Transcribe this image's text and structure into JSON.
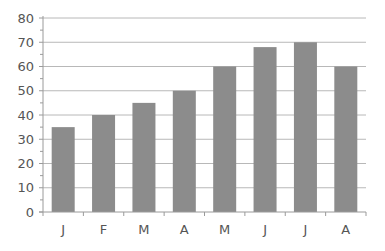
{
  "chart_data": {
    "type": "bar",
    "title": "",
    "xlabel": "",
    "ylabel": "",
    "categories": [
      "J",
      "F",
      "M",
      "A",
      "M",
      "J",
      "J",
      "A"
    ],
    "values": [
      35,
      40,
      45,
      50,
      60,
      68,
      70,
      60
    ],
    "ylim": [
      0,
      80
    ],
    "yticks": [
      0,
      10,
      20,
      30,
      40,
      50,
      60,
      70,
      80
    ],
    "grid": true,
    "legend": null,
    "colors": {
      "bar": "#8c8c8c",
      "grid": "#b8b8b8",
      "axis": "#9a9a9a",
      "tick_label": "#555555"
    }
  }
}
